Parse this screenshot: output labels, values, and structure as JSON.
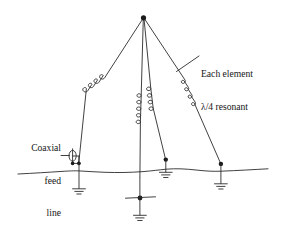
{
  "figure": {
    "type": "antenna-schematic",
    "background_color": "#ffffff",
    "line_color": "#2b2b2b",
    "text_color": "#161616"
  },
  "labels": {
    "each_element": {
      "name": "each-element-annotation",
      "line1": "Each element",
      "line2": "λ/4 resonant"
    },
    "coaxial_feed": {
      "name": "coaxial-feed-annotation",
      "line1": "Coaxial",
      "line2": "feed",
      "line3": "line"
    }
  },
  "geometry": {
    "apex": {
      "x": 143.5,
      "y": 17.5
    },
    "ground_line_y": 172,
    "elements": [
      {
        "id": "element-left",
        "base_x": 79,
        "base_y": 163,
        "coil": true
      },
      {
        "id": "element-center",
        "base_x": 143.5,
        "base_y": 178,
        "coil": true
      },
      {
        "id": "element-center-right",
        "base_x": 166,
        "base_y": 160.5,
        "coil": true
      },
      {
        "id": "element-right",
        "base_x": 221,
        "base_y": 164.5,
        "coil": true
      }
    ],
    "coils": [
      {
        "id": "coil-left",
        "turns": 4
      },
      {
        "id": "coil-center",
        "turns": 5
      },
      {
        "id": "coil-center-right",
        "turns": 4
      },
      {
        "id": "coil-right",
        "turns": 4
      }
    ],
    "ground_symbols": [
      {
        "id": "ground-left-feed",
        "x": 79,
        "top_y": 172,
        "bars": 3
      },
      {
        "id": "ground-center",
        "x": 143.5,
        "top_y": 205,
        "bars": 3
      },
      {
        "id": "ground-center-right",
        "x": 166,
        "top_y": 165.5,
        "bars": 3
      },
      {
        "id": "ground-right",
        "x": 221,
        "top_y": 169,
        "bars": 3
      }
    ],
    "feed_point": {
      "x": 69,
      "y": 156,
      "symbol": "coax-connector"
    }
  }
}
